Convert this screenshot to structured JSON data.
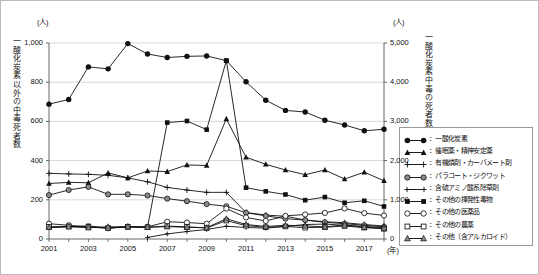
{
  "axes": {
    "left_unit": "(人)",
    "right_unit": "(人)",
    "left_title": "一酸化炭素以外の中毒死者数",
    "right_title": "一酸化炭素中毒の死者数",
    "x_unit": "(年)",
    "left_ticks": [
      "1,000",
      "800",
      "600",
      "400",
      "200",
      "0"
    ],
    "right_ticks": [
      "5,000",
      "4,000",
      "3,000",
      "2,000",
      "1,000",
      "0"
    ],
    "x_ticks": [
      "2001",
      "2003",
      "2005",
      "2007",
      "2009",
      "2011",
      "2013",
      "2015",
      "2017"
    ]
  },
  "legend": {
    "items": [
      {
        "label": "一酸化炭素",
        "marker": "filled-circle"
      },
      {
        "label": "催眠薬・精神安定薬",
        "marker": "filled-triangle"
      },
      {
        "label": "有機燐剤・カーバメート剤",
        "marker": "plus"
      },
      {
        "label": "パラコート・ジクワット",
        "marker": "shaded-circle"
      },
      {
        "label": "含硫アミノ酸系除草剤",
        "marker": "line-only"
      },
      {
        "label": "その他の揮発性毒物",
        "marker": "filled-square"
      },
      {
        "label": "その他の医薬品",
        "marker": "open-circle"
      },
      {
        "label": "その他の農薬",
        "marker": "open-square"
      },
      {
        "label": "その他（含アルカロイド）",
        "marker": "shaded-triangle"
      }
    ]
  },
  "chart_data": {
    "type": "line",
    "title": "",
    "xlabel": "(年)",
    "ylabel": "一酸化炭素以外の中毒死者数",
    "y2label": "一酸化炭素中毒の死者数",
    "x": [
      2001,
      2002,
      2003,
      2004,
      2005,
      2006,
      2007,
      2008,
      2009,
      2010,
      2011,
      2012,
      2013,
      2014,
      2015,
      2016,
      2017,
      2018
    ],
    "xlim": [
      2001,
      2018
    ],
    "ylim": [
      0,
      1000
    ],
    "y2lim": [
      0,
      5000
    ],
    "grid": true,
    "legend_position": "right",
    "series": [
      {
        "name": "一酸化炭素",
        "axis": "right",
        "marker": "filled-circle",
        "values": [
          3440,
          3560,
          4390,
          4340,
          4985,
          4720,
          4630,
          4660,
          4670,
          4550,
          4010,
          3540,
          3280,
          3240,
          3030,
          2910,
          2760,
          2800
        ]
      },
      {
        "name": "催眠薬・精神安定薬",
        "axis": "left",
        "marker": "filled-triangle",
        "values": [
          283,
          289,
          287,
          337,
          312,
          347,
          344,
          378,
          375,
          613,
          417,
          381,
          352,
          328,
          352,
          306,
          341,
          297
        ]
      },
      {
        "name": "有機燐剤・カーバメート剤",
        "axis": "left",
        "marker": "plus",
        "values": [
          335,
          332,
          330,
          325,
          312,
          292,
          263,
          250,
          238,
          238,
          135,
          122,
          116,
          97,
          88,
          83,
          74,
          66
        ]
      },
      {
        "name": "パラコート・ジクワット",
        "axis": "left",
        "marker": "shaded-circle",
        "values": [
          224,
          250,
          266,
          228,
          228,
          222,
          206,
          193,
          178,
          167,
          134,
          118,
          104,
          96,
          85,
          78,
          70,
          62
        ]
      },
      {
        "name": "含硫アミノ酸系除草剤",
        "axis": "left",
        "marker": "line-only",
        "values": [
          0,
          0,
          0,
          0,
          0,
          8,
          26,
          38,
          49,
          65,
          59,
          55,
          64,
          74,
          76,
          70,
          64,
          58
        ]
      },
      {
        "name": "その他の揮発性毒物",
        "axis": "left",
        "marker": "filled-square",
        "values": [
          58,
          62,
          67,
          56,
          61,
          60,
          594,
          602,
          558,
          910,
          262,
          243,
          227,
          198,
          214,
          185,
          195,
          166
        ]
      },
      {
        "name": "その他の医薬品",
        "axis": "left",
        "marker": "open-circle",
        "values": [
          78,
          70,
          62,
          55,
          63,
          62,
          88,
          84,
          78,
          155,
          110,
          92,
          118,
          125,
          133,
          156,
          132,
          120
        ]
      },
      {
        "name": "その他の農薬",
        "axis": "left",
        "marker": "open-square",
        "values": [
          62,
          64,
          60,
          56,
          62,
          60,
          66,
          62,
          56,
          94,
          68,
          60,
          64,
          58,
          60,
          66,
          58,
          52
        ]
      },
      {
        "name": "その他（含アルカロイド）",
        "axis": "left",
        "marker": "shaded-triangle",
        "values": [
          60,
          63,
          58,
          62,
          63,
          60,
          63,
          60,
          58,
          103,
          74,
          64,
          70,
          67,
          62,
          72,
          60,
          55
        ]
      }
    ]
  }
}
